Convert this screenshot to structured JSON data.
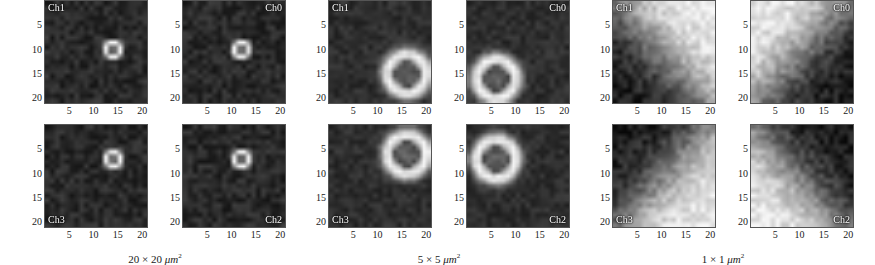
{
  "figure": {
    "axis": {
      "x_ticks": [
        5,
        10,
        15,
        20
      ],
      "y_ticks": [
        5,
        10,
        15,
        20
      ],
      "grid_size": 21,
      "tick_positions": [
        5,
        10,
        15,
        20
      ]
    },
    "colormap": "grayscale",
    "colors": {
      "background": "#ffffff",
      "text": "#1a1a1a",
      "panel_border": "#555555",
      "label_text": "#ffffff",
      "map_low": "#0d0d0d",
      "map_high": "#f5f5f5"
    },
    "groups": [
      {
        "id": "group-20um",
        "caption_value": "20 × 20",
        "caption_unit": "μm",
        "caption_exp": "2",
        "panels": [
          {
            "label": "Ch1",
            "label_corner": "tl",
            "pattern": "spot",
            "center_x": 14,
            "center_y": 10,
            "spot_radius": 1.6,
            "base_level": 0.14,
            "peak_level": 1.0,
            "noise": 0.09,
            "seed": 11
          },
          {
            "label": "Ch0",
            "label_corner": "tr",
            "pattern": "spot",
            "center_x": 12,
            "center_y": 10,
            "spot_radius": 1.6,
            "base_level": 0.14,
            "peak_level": 1.0,
            "noise": 0.09,
            "seed": 12
          },
          {
            "label": "Ch3",
            "label_corner": "bl",
            "pattern": "spot",
            "center_x": 14,
            "center_y": 7,
            "spot_radius": 1.6,
            "base_level": 0.14,
            "peak_level": 1.0,
            "noise": 0.09,
            "seed": 13
          },
          {
            "label": "Ch2",
            "label_corner": "br",
            "pattern": "spot",
            "center_x": 12,
            "center_y": 7,
            "spot_radius": 1.6,
            "base_level": 0.14,
            "peak_level": 1.0,
            "noise": 0.09,
            "seed": 14
          }
        ]
      },
      {
        "id": "group-5um",
        "caption_value": "5 × 5",
        "caption_unit": "μm",
        "caption_exp": "2",
        "panels": [
          {
            "label": "Ch1",
            "label_corner": "tl",
            "pattern": "ring",
            "center_x": 16,
            "center_y": 15,
            "ring_radius": 4.0,
            "ring_width": 2.2,
            "base_level": 0.16,
            "peak_level": 1.0,
            "core_level": 0.2,
            "noise": 0.07,
            "seed": 21
          },
          {
            "label": "Ch0",
            "label_corner": "tr",
            "pattern": "ring",
            "center_x": 6,
            "center_y": 16,
            "ring_radius": 4.0,
            "ring_width": 2.2,
            "base_level": 0.16,
            "peak_level": 1.0,
            "core_level": 0.2,
            "noise": 0.07,
            "seed": 22
          },
          {
            "label": "Ch3",
            "label_corner": "bl",
            "pattern": "ring",
            "center_x": 16,
            "center_y": 6,
            "ring_radius": 4.0,
            "ring_width": 2.2,
            "base_level": 0.16,
            "peak_level": 1.0,
            "core_level": 0.2,
            "noise": 0.07,
            "seed": 23
          },
          {
            "label": "Ch2",
            "label_corner": "br",
            "pattern": "ring",
            "center_x": 6,
            "center_y": 7,
            "ring_radius": 4.0,
            "ring_width": 2.2,
            "base_level": 0.16,
            "peak_level": 1.0,
            "core_level": 0.2,
            "noise": 0.07,
            "seed": 24
          }
        ]
      },
      {
        "id": "group-1um",
        "caption_value": "1 × 1",
        "caption_unit": "μm",
        "caption_exp": "2",
        "panels": [
          {
            "label": "Ch1",
            "label_corner": "tl",
            "pattern": "gradient",
            "dir_x": 0.75,
            "dir_y": 0.66,
            "base_level": 0.06,
            "peak_level": 0.96,
            "edge_sharpness": 3.4,
            "noise": 0.12,
            "seed": 31
          },
          {
            "label": "Ch0",
            "label_corner": "tr",
            "pattern": "gradient",
            "dir_x": -0.75,
            "dir_y": 0.66,
            "base_level": 0.06,
            "peak_level": 0.96,
            "edge_sharpness": 3.4,
            "noise": 0.12,
            "seed": 32
          },
          {
            "label": "Ch3",
            "label_corner": "bl",
            "pattern": "gradient",
            "dir_x": 0.75,
            "dir_y": -0.66,
            "base_level": 0.06,
            "peak_level": 0.96,
            "edge_sharpness": 3.4,
            "noise": 0.12,
            "seed": 33
          },
          {
            "label": "Ch2",
            "label_corner": "br",
            "pattern": "gradient",
            "dir_x": -0.75,
            "dir_y": -0.66,
            "base_level": 0.06,
            "peak_level": 0.96,
            "edge_sharpness": 3.4,
            "noise": 0.12,
            "seed": 34
          }
        ]
      }
    ]
  },
  "chart_data": {
    "type": "heatmap",
    "title": "",
    "xlabel": "",
    "ylabel": "",
    "xlim": [
      0,
      21
    ],
    "ylim": [
      0,
      21
    ],
    "grid": false,
    "colormap": "gray",
    "panel_count": 12,
    "panel_grid": "2x2 per group, 3 groups",
    "legend_position": "none",
    "annotations": [
      "Ch0",
      "Ch1",
      "Ch2",
      "Ch3"
    ],
    "group_captions": [
      "20 × 20 μm²",
      "5 × 5 μm²",
      "1 × 1 μm²"
    ],
    "x_ticklabels": [
      "5",
      "10",
      "15",
      "20"
    ],
    "y_ticklabels": [
      "5",
      "10",
      "15",
      "20"
    ],
    "series": [
      {
        "name": "20x20 Ch1",
        "feature": "bright point spot",
        "peak_xy": [
          14,
          10
        ]
      },
      {
        "name": "20x20 Ch0",
        "feature": "bright point spot",
        "peak_xy": [
          12,
          10
        ]
      },
      {
        "name": "20x20 Ch3",
        "feature": "bright point spot",
        "peak_xy": [
          14,
          7
        ]
      },
      {
        "name": "20x20 Ch2",
        "feature": "bright point spot",
        "peak_xy": [
          12,
          7
        ]
      },
      {
        "name": "5x5 Ch1",
        "feature": "bright ring with dark core",
        "peak_xy": [
          16,
          15
        ]
      },
      {
        "name": "5x5 Ch0",
        "feature": "bright ring with dark core",
        "peak_xy": [
          6,
          16
        ]
      },
      {
        "name": "5x5 Ch3",
        "feature": "bright ring with dark core",
        "peak_xy": [
          16,
          6
        ]
      },
      {
        "name": "5x5 Ch2",
        "feature": "bright ring with dark core",
        "peak_xy": [
          6,
          7
        ]
      },
      {
        "name": "1x1 Ch1",
        "feature": "diagonal gradient bright lower-right"
      },
      {
        "name": "1x1 Ch0",
        "feature": "diagonal gradient bright lower-left"
      },
      {
        "name": "1x1 Ch3",
        "feature": "diagonal gradient bright upper-right"
      },
      {
        "name": "1x1 Ch2",
        "feature": "diagonal gradient bright upper-left"
      }
    ]
  }
}
